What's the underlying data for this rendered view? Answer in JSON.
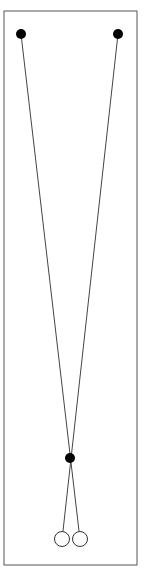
{
  "figure": {
    "type": "pendulum-diagram",
    "frame": {
      "x": 4,
      "y": 11,
      "width": 133,
      "height": 554,
      "stroke": "#555555"
    },
    "pivots": [
      {
        "name": "top-left-pivot",
        "cx": 21,
        "cy": 34,
        "r": 5,
        "fill": "#000000"
      },
      {
        "name": "top-right-pivot",
        "cx": 118,
        "cy": 34,
        "r": 5,
        "fill": "#000000"
      }
    ],
    "crossing_point": {
      "cx": 70,
      "cy": 458,
      "r": 5,
      "fill": "#000000"
    },
    "bobs": [
      {
        "name": "left-bob",
        "cx": 62,
        "cy": 539,
        "r": 7.5,
        "fill": "#ffffff",
        "stroke": "#333333"
      },
      {
        "name": "right-bob",
        "cx": 80,
        "cy": 539,
        "r": 7.5,
        "fill": "#ffffff",
        "stroke": "#333333"
      }
    ],
    "strings": [
      {
        "name": "string-left-pivot-to-right-bob",
        "x1": 21,
        "y1": 34,
        "x2": 79,
        "y2": 531
      },
      {
        "name": "string-right-pivot-to-left-bob",
        "x1": 118,
        "y1": 34,
        "x2": 63,
        "y2": 531
      }
    ],
    "line_color": "#444444"
  }
}
